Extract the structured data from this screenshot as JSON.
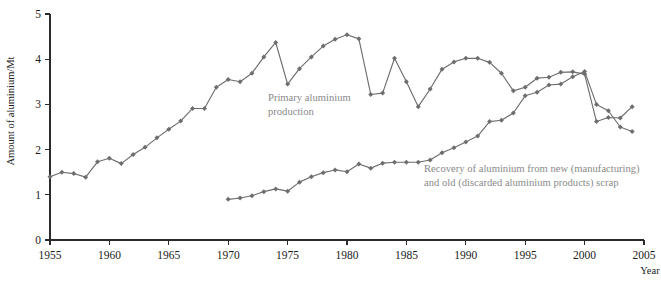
{
  "chart_data": {
    "type": "line",
    "title": "",
    "xlabel": "Year",
    "ylabel": "Amount of aluminium/Mt",
    "xlim": [
      1954,
      2005
    ],
    "ylim": [
      0,
      5
    ],
    "grid": false,
    "legend_position": "inline-annotation",
    "x_ticks": [
      1955,
      1960,
      1965,
      1970,
      1975,
      1980,
      1985,
      1990,
      1995,
      2000,
      2005
    ],
    "x_tick_labels": [
      "1955",
      "1960",
      "1965",
      "1970",
      "1975",
      "1980",
      "1985",
      "1990",
      "1995",
      "2000",
      "2005"
    ],
    "y_ticks": [
      0,
      1,
      2,
      3,
      4,
      5
    ],
    "y_tick_labels": [
      "0",
      "1",
      "2",
      "3",
      "4",
      "5"
    ],
    "marker": "diamond",
    "series": [
      {
        "name": "Primary aluminium production",
        "annotation_lines": [
          "Primary aluminium",
          "production"
        ],
        "color": "#6e6e6e",
        "x": [
          1955,
          1956,
          1957,
          1958,
          1959,
          1960,
          1961,
          1962,
          1963,
          1964,
          1965,
          1966,
          1967,
          1968,
          1969,
          1970,
          1971,
          1972,
          1973,
          1974,
          1975,
          1976,
          1977,
          1978,
          1979,
          1980,
          1981,
          1982,
          1983,
          1984,
          1985,
          1986,
          1987,
          1988,
          1989,
          1990,
          1991,
          1992,
          1993,
          1994,
          1995,
          1996,
          1997,
          1998,
          1999,
          2000,
          2001,
          2002,
          2003,
          2004
        ],
        "values": [
          1.4,
          1.5,
          1.47,
          1.39,
          1.73,
          1.81,
          1.69,
          1.89,
          2.05,
          2.26,
          2.45,
          2.63,
          2.91,
          2.91,
          3.38,
          3.55,
          3.5,
          3.69,
          4.05,
          4.37,
          3.45,
          3.79,
          4.05,
          4.29,
          4.44,
          4.54,
          4.45,
          3.22,
          3.25,
          4.02,
          3.5,
          2.95,
          3.34,
          3.78,
          3.94,
          4.02,
          4.02,
          3.93,
          3.69,
          3.3,
          3.38,
          3.58,
          3.6,
          3.71,
          3.72,
          3.67,
          2.62,
          2.71,
          2.7,
          2.95
        ]
      },
      {
        "name": "Recovery of aluminium from new (manufacturing) and old (discarded aluminium products) scrap",
        "annotation_lines": [
          "Recovery of aluminium from new (manufacturing)",
          "and old (discarded aluminium products) scrap"
        ],
        "color": "#6e6e6e",
        "x": [
          1970,
          1971,
          1972,
          1973,
          1974,
          1975,
          1976,
          1977,
          1978,
          1979,
          1980,
          1981,
          1982,
          1983,
          1984,
          1985,
          1986,
          1987,
          1988,
          1989,
          1990,
          1991,
          1992,
          1993,
          1994,
          1995,
          1996,
          1997,
          1998,
          1999,
          2000,
          2001,
          2002,
          2003,
          2004
        ],
        "values": [
          0.9,
          0.93,
          0.98,
          1.07,
          1.13,
          1.08,
          1.28,
          1.4,
          1.49,
          1.55,
          1.51,
          1.68,
          1.59,
          1.7,
          1.72,
          1.72,
          1.72,
          1.77,
          1.93,
          2.04,
          2.17,
          2.3,
          2.62,
          2.65,
          2.81,
          3.19,
          3.27,
          3.43,
          3.45,
          3.61,
          3.73,
          3.0,
          2.86,
          2.5,
          2.4
        ]
      }
    ]
  },
  "footer": {
    "caption": ""
  }
}
